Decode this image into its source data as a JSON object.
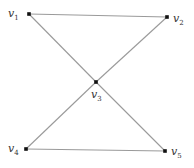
{
  "diagram": {
    "type": "graph",
    "nodes": [
      {
        "id": "v1",
        "label": "v",
        "sub": "1",
        "x": 29,
        "y": 14,
        "lx": 8,
        "ly": 17
      },
      {
        "id": "v2",
        "label": "v",
        "sub": "2",
        "x": 167,
        "y": 17,
        "lx": 173,
        "ly": 22
      },
      {
        "id": "v3",
        "label": "v",
        "sub": "3",
        "x": 96,
        "y": 82,
        "lx": 91,
        "ly": 98
      },
      {
        "id": "v4",
        "label": "v",
        "sub": "4",
        "x": 26,
        "y": 149,
        "lx": 8,
        "ly": 152
      },
      {
        "id": "v5",
        "label": "v",
        "sub": "5",
        "x": 165,
        "y": 151,
        "lx": 171,
        "ly": 155
      }
    ],
    "edges": [
      {
        "from": "v1",
        "to": "v2"
      },
      {
        "from": "v1",
        "to": "v3"
      },
      {
        "from": "v3",
        "to": "v5"
      },
      {
        "from": "v2",
        "to": "v3"
      },
      {
        "from": "v3",
        "to": "v4"
      },
      {
        "from": "v4",
        "to": "v5"
      }
    ]
  }
}
